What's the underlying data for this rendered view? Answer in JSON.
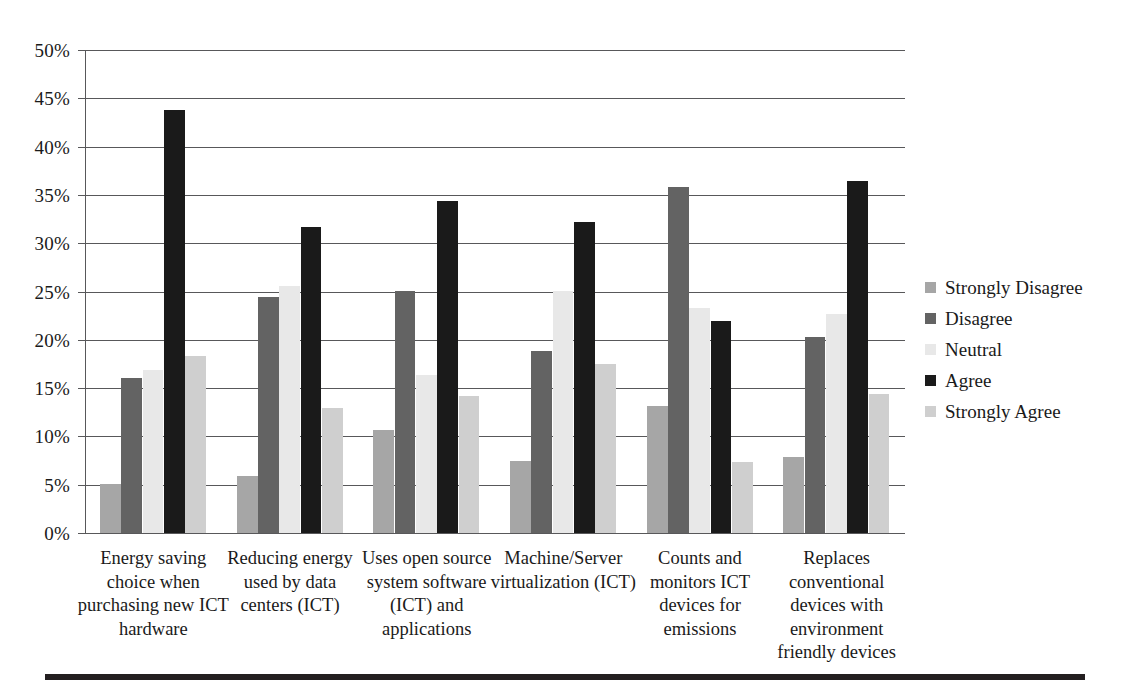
{
  "chart_data": {
    "type": "bar",
    "title": "",
    "subtitle": "",
    "xlabel": "",
    "ylabel": "",
    "ylim": [
      0,
      50
    ],
    "ytick_labels": [
      "0%",
      "5%",
      "10%",
      "15%",
      "20%",
      "25%",
      "30%",
      "35%",
      "40%",
      "45%",
      "50%"
    ],
    "ytick_values": [
      0,
      5,
      10,
      15,
      20,
      25,
      30,
      35,
      40,
      45,
      50
    ],
    "grid": true,
    "legend_position": "right",
    "categories": [
      "Energy saving choice when purchasing new ICT hardware",
      "Reducing energy used by data centers (ICT)",
      "Uses open source system software (ICT) and applications",
      "Machine/Server virtualization (ICT)",
      "Counts and monitors ICT devices for emissions",
      "Replaces conventional devices with environment friendly devices"
    ],
    "category_lines": [
      [
        "Energy saving",
        "choice when",
        "purchasing new ICT",
        "hardware"
      ],
      [
        "Reducing energy",
        "used by data",
        "centers (ICT)"
      ],
      [
        "Uses open source",
        "system software",
        "(ICT) and",
        "applications"
      ],
      [
        "Machine/Server",
        "virtualization (ICT)"
      ],
      [
        "Counts and",
        "monitors ICT",
        "devices for",
        "emissions"
      ],
      [
        "Replaces",
        "conventional",
        "devices with",
        "environment",
        "friendly devices"
      ]
    ],
    "series": [
      {
        "name": "Strongly Disagree",
        "color": "#a6a6a6",
        "values": [
          5.1,
          5.9,
          10.7,
          7.5,
          13.1,
          7.9
        ]
      },
      {
        "name": "Disagree",
        "color": "#636363",
        "values": [
          16.0,
          24.4,
          25.1,
          18.8,
          35.8,
          20.3
        ]
      },
      {
        "name": "Neutral",
        "color": "#e8e8e8",
        "values": [
          16.9,
          25.6,
          16.4,
          25.1,
          23.3,
          22.7
        ]
      },
      {
        "name": "Agree",
        "color": "#1a1a1a",
        "values": [
          43.8,
          31.7,
          34.4,
          32.2,
          21.9,
          36.4
        ]
      },
      {
        "name": "Strongly Agree",
        "color": "#cfcfcf",
        "values": [
          18.3,
          12.9,
          14.2,
          17.5,
          7.3,
          14.4
        ]
      }
    ]
  },
  "legend": {
    "items": [
      {
        "label": "Strongly Disagree",
        "color": "#a6a6a6"
      },
      {
        "label": "Disagree",
        "color": "#636363"
      },
      {
        "label": "Neutral",
        "color": "#e8e8e8"
      },
      {
        "label": "Agree",
        "color": "#1a1a1a"
      },
      {
        "label": "Strongly Agree",
        "color": "#cfcfcf"
      }
    ]
  },
  "axis": {
    "y_ticks": [
      "50%",
      "45%",
      "40%",
      "35%",
      "30%",
      "25%",
      "20%",
      "15%",
      "10%",
      "5%",
      "0%"
    ]
  },
  "colors": {
    "gridline": "#58585a",
    "rule": "#231f20",
    "text": "#1a1a1a",
    "background": "#ffffff"
  }
}
